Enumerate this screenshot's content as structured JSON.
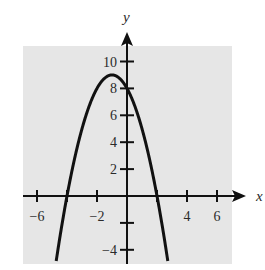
{
  "chart_data": {
    "type": "line",
    "title": "",
    "xlabel": "x",
    "ylabel": "y",
    "xlim": [
      -7,
      7
    ],
    "ylim": [
      -5,
      11
    ],
    "x_ticks": [
      -6,
      -4,
      -2,
      2,
      4,
      6
    ],
    "x_tick_labels": [
      "-6",
      "-2",
      "4",
      "6"
    ],
    "x_labeled_ticks": [
      -6,
      -2,
      4,
      6
    ],
    "y_ticks": [
      -4,
      -2,
      2,
      4,
      6,
      8,
      10
    ],
    "y_tick_labels": [
      "-4",
      "2",
      "4",
      "6",
      "8",
      "10"
    ],
    "y_labeled_ticks": [
      -4,
      2,
      4,
      6,
      8,
      10
    ],
    "grid": false,
    "background": "#e6e6e6",
    "series": [
      {
        "name": "y = -x^2 - 2x + 8",
        "equation": "y = -(x+1)^2 + 9",
        "vertex": [
          -1,
          9
        ],
        "y_intercept": 8,
        "roots": [
          -4,
          2
        ],
        "x": [
          -5.05,
          -5,
          -4.5,
          -4,
          -3.5,
          -3,
          -2.5,
          -2,
          -1.5,
          -1,
          -0.5,
          0,
          0.5,
          1,
          1.5,
          2,
          2.5,
          3,
          3.05
        ],
        "y": [
          -7.4,
          -7,
          -3.25,
          0,
          2.75,
          5,
          6.75,
          8,
          8.75,
          9,
          8.75,
          8,
          6.75,
          5,
          2.75,
          0,
          -3.25,
          -7,
          -7.4
        ]
      }
    ]
  }
}
